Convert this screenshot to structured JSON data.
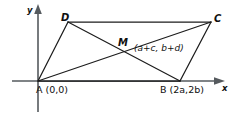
{
  "figure": {
    "axes": {
      "x_label": "x",
      "y_label": "y"
    },
    "vertices": [
      {
        "name": "A",
        "label": "A",
        "coord_text": "(0,0)",
        "full_text": "A (0,0)"
      },
      {
        "name": "B",
        "label": "B",
        "coord_text": "(2a,2b)",
        "full_text": "B (2a,2b)"
      },
      {
        "name": "C",
        "label": "C",
        "coord_text": "",
        "full_text": "C"
      },
      {
        "name": "D",
        "label": "D",
        "coord_text": "",
        "full_text": "D"
      },
      {
        "name": "M",
        "label": "M",
        "coord_text": "(a+c, b+d)",
        "full_text": "M (a+c, b+d)"
      }
    ],
    "labels": {
      "A": "A",
      "A_coord": "(0,0)",
      "B": "B",
      "B_coord": "(2a,2b)",
      "C": "C",
      "D": "D",
      "M": "M",
      "M_coord": "(a+c, b+d)"
    },
    "colors": {
      "axis": "#555a5e",
      "shape": "#1c1c1c",
      "background": "#ffffff",
      "text": "#101010"
    }
  }
}
